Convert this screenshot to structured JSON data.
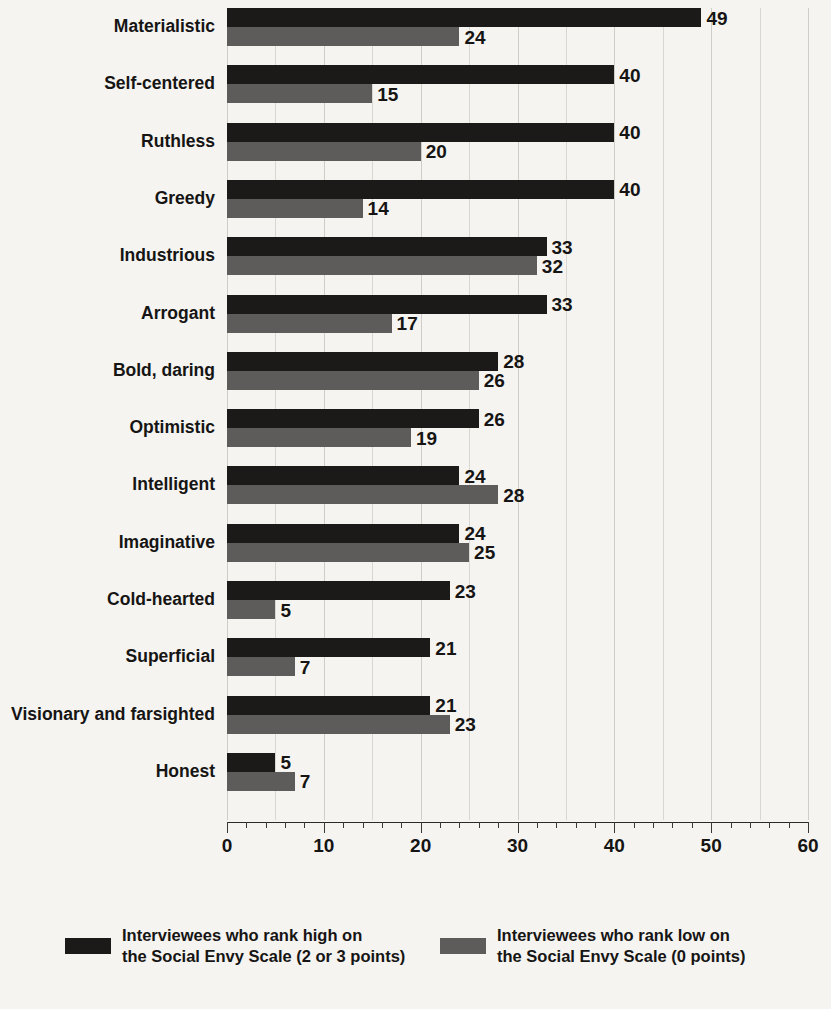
{
  "chart_data": {
    "type": "bar",
    "orientation": "horizontal",
    "title": "",
    "xlabel": "",
    "ylabel": "",
    "xlim": [
      0,
      60
    ],
    "xticks": [
      0,
      10,
      20,
      30,
      40,
      50,
      60
    ],
    "xtick_labels": [
      "0",
      "10",
      "20",
      "30",
      "40",
      "50",
      "60"
    ],
    "minor_tick_step": 2,
    "grid": true,
    "grid_axis": "x",
    "grid_step": 5,
    "legend_position": "bottom",
    "categories": [
      "Materialistic",
      "Self-centered",
      "Ruthless",
      "Greedy",
      "Industrious",
      "Arrogant",
      "Bold, daring",
      "Optimistic",
      "Intelligent",
      "Imaginative",
      "Cold-hearted",
      "Superficial",
      "Visionary and farsighted",
      "Honest"
    ],
    "series": [
      {
        "name": "Interviewees who rank high on the Social Envy Scale (2 or 3 points)",
        "key": "high",
        "color": "#1b1a19",
        "values": [
          49,
          40,
          40,
          40,
          33,
          33,
          28,
          26,
          24,
          24,
          23,
          21,
          21,
          5
        ]
      },
      {
        "name": "Interviewees who rank low on the Social Envy Scale (0 points)",
        "key": "low",
        "color": "#5d5c5a",
        "values": [
          24,
          15,
          20,
          14,
          32,
          17,
          26,
          19,
          28,
          25,
          5,
          7,
          23,
          7
        ]
      }
    ]
  },
  "legend": [
    {
      "swatch_color": "#1b1a19",
      "line1": "Interviewees who rank high on",
      "line2": "the Social Envy Scale (2 or 3 points)"
    },
    {
      "swatch_color": "#5d5c5a",
      "line1": "Interviewees who rank low on",
      "line2": "the Social Envy Scale (0 points)"
    }
  ],
  "colors": {
    "background": "#f5f4f1",
    "high_bar": "#1b1a19",
    "low_bar": "#5d5c5a",
    "gridline": "#d9d7d2",
    "axis": "#2b2a29",
    "text": "#161514"
  }
}
